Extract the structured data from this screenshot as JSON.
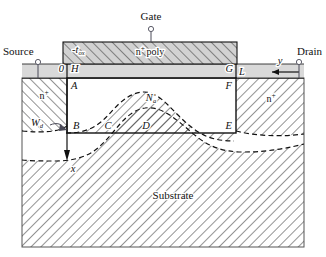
{
  "figure": {
    "title_internal": "MOSFET cross-section with depletion region",
    "background_color": "#ffffff",
    "line_color": "#111111"
  },
  "colors": {
    "oxide_fill": "#d9d9d9",
    "poly_fill": "#d2d2d2",
    "hatch_stroke": "#3a3a3a",
    "substrate_fill": "#ffffff",
    "frame_stroke": "#555555",
    "leader_stroke": "#4a4a58"
  },
  "terminals": [
    {
      "id": "source",
      "label": "Source"
    },
    {
      "id": "gate",
      "label": "Gate"
    },
    {
      "id": "drain",
      "label": "Drain"
    }
  ],
  "regions": [
    {
      "id": "gate-poly",
      "label": "n",
      "superscript": "+",
      "label_tail": "poly"
    },
    {
      "id": "source-diffusion",
      "label": "n",
      "superscript": "+"
    },
    {
      "id": "drain-diffusion",
      "label": "n",
      "superscript": "+"
    },
    {
      "id": "body-doping",
      "label": "N",
      "subscript": "a"
    },
    {
      "id": "substrate",
      "label": "Substrate"
    }
  ],
  "labels": {
    "oxide_thickness": {
      "base": "-t",
      "sub": "ox"
    },
    "origin": "0",
    "depletion_width": {
      "base": "W",
      "sub": "d"
    },
    "channel_length": "L",
    "axis_y": "y",
    "axis_x": "x",
    "poly_base": "n",
    "poly_sup": "+",
    "poly_tail": "poly",
    "nplus_base": "n",
    "nplus_sup": "+",
    "body_base": "N",
    "body_sub": "a",
    "substrate": "Substrate"
  },
  "nodes": [
    {
      "id": "H",
      "label": "H"
    },
    {
      "id": "G",
      "label": "G"
    },
    {
      "id": "A",
      "label": "A"
    },
    {
      "id": "F",
      "label": "F"
    },
    {
      "id": "B",
      "label": "B"
    },
    {
      "id": "C",
      "label": "C"
    },
    {
      "id": "D",
      "label": "D"
    },
    {
      "id": "E",
      "label": "E"
    }
  ],
  "axes": {
    "y_axis": {
      "label": "y",
      "direction": "left",
      "origin_label": "0"
    },
    "x_axis": {
      "label": "x",
      "direction": "down"
    }
  }
}
